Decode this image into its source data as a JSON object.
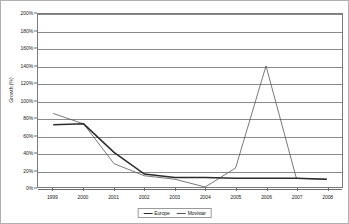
{
  "chart_data": {
    "type": "line",
    "title": "",
    "xlabel": "",
    "ylabel": "Growth (%)",
    "categories": [
      "1999",
      "2000",
      "2001",
      "2002",
      "2003",
      "2004",
      "2005",
      "2006",
      "2007",
      "2008"
    ],
    "x": [
      1999,
      2000,
      2001,
      2002,
      2003,
      2004,
      2005,
      2006,
      2007,
      2008
    ],
    "ylim": [
      0,
      200
    ],
    "ytick_step": 20,
    "ytick_labels": [
      "0%",
      "20%",
      "40%",
      "60%",
      "80%",
      "100%",
      "120%",
      "140%",
      "160%",
      "180%",
      "200%"
    ],
    "ytick_values": [
      0,
      20,
      40,
      60,
      80,
      100,
      120,
      140,
      160,
      180,
      200
    ],
    "grid": "horizontal",
    "legend_position": "bottom-center",
    "series": [
      {
        "name": "Europe",
        "color": "#2b2b2b",
        "width": 1.5,
        "values": [
          72,
          73,
          40,
          15,
          11,
          11,
          10,
          10,
          10,
          9
        ]
      },
      {
        "name": "Movistar",
        "color": "#555555",
        "width": 0.8,
        "values": [
          85,
          73,
          27,
          13,
          9,
          0,
          22,
          140,
          10,
          9
        ]
      }
    ]
  },
  "legend": {
    "entries": [
      {
        "label": "Europe"
      },
      {
        "label": "Movistar"
      }
    ]
  },
  "colors": {
    "europe": "#2b2b2b",
    "movistar": "#555555",
    "gridline": "#8a8a8a",
    "axis": "#6d6d6d",
    "frame": "#b0b0b0",
    "text": "#1a1a1a"
  }
}
